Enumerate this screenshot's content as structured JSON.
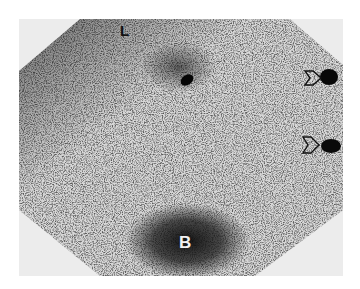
{
  "image": {
    "kind": "gamma-camera scintigraphy scan (grayscale)",
    "field_of_view_shape": "clipped-corner octagon",
    "background_color": "#ffffff",
    "paper_color": "#ececec",
    "count_color": "#1a1a1a"
  },
  "labels": {
    "top_left": "L",
    "bottom_center": "B"
  },
  "hotspots": [
    {
      "name": "upper-center-focus",
      "x": 167,
      "y": 60,
      "desc": "small dense dark spot with faint halo"
    },
    {
      "name": "right-upper-focus",
      "x": 310,
      "y": 57,
      "desc": "dark blob with outlined arrowhead marker to its left"
    },
    {
      "name": "right-middle-focus",
      "x": 310,
      "y": 125,
      "desc": "dark blob with outlined arrowhead marker to its left"
    },
    {
      "name": "bladder-activity",
      "x": 168,
      "y": 225,
      "desc": "large diffuse dark region labeled B"
    }
  ],
  "markers": [
    {
      "name": "arrowhead-marker-upper",
      "x": 292,
      "y": 58
    },
    {
      "name": "arrowhead-marker-middle",
      "x": 289,
      "y": 126
    }
  ]
}
